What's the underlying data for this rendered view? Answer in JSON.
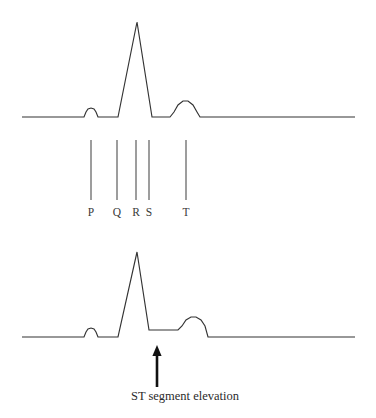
{
  "figure": {
    "title": "ECG waveform comparison: normal rhythm and ST segment elevation",
    "background_color": "#ffffff",
    "trace_color": "#333333",
    "tick_color": "#555555",
    "arrow_color": "#111111",
    "label_color": "#3a3a3a",
    "caption_color": "#2b2b2b"
  },
  "chart_data": {
    "type": "line",
    "title": "ECG waveform comparison: normal rhythm and ST segment elevation",
    "xlabel": "",
    "ylabel": "",
    "grid": false,
    "legend": "none",
    "xlim": [
      0,
      376
    ],
    "ylim": [
      418,
      0
    ],
    "note": "Coordinates are in screenshot pixel space; y increases downward. Amplitude is inverted relative to voltage (smaller y = taller deflection).",
    "series": [
      {
        "name": "normal-ecg-trace",
        "baseline_y": 117,
        "x_start": 22,
        "x_end": 355,
        "points": [
          [
            22,
            117
          ],
          [
            84,
            117
          ],
          [
            86,
            112
          ],
          [
            88,
            109
          ],
          [
            91,
            108
          ],
          [
            94,
            109
          ],
          [
            96,
            112
          ],
          [
            98,
            117
          ],
          [
            117,
            117
          ],
          [
            118,
            117
          ],
          [
            137,
            22
          ],
          [
            152,
            117
          ],
          [
            170,
            117
          ],
          [
            174,
            112
          ],
          [
            178,
            105
          ],
          [
            183,
            101
          ],
          [
            188,
            101
          ],
          [
            193,
            105
          ],
          [
            197,
            112
          ],
          [
            200,
            117
          ],
          [
            355,
            117
          ]
        ],
        "features": [
          {
            "label": "P",
            "x": 91,
            "peak_y": 108,
            "kind": "rounded-bump"
          },
          {
            "label": "Q",
            "x": 117,
            "peak_y": 117,
            "kind": "baseline-junction"
          },
          {
            "label": "R",
            "x": 137,
            "peak_y": 22,
            "kind": "sharp-spike"
          },
          {
            "label": "S",
            "x": 152,
            "peak_y": 117,
            "kind": "baseline-junction"
          },
          {
            "label": "T",
            "x": 186,
            "peak_y": 101,
            "kind": "rounded-dome"
          }
        ]
      },
      {
        "name": "st-elevation-ecg-trace",
        "baseline_y": 337,
        "st_segment_y": 330,
        "x_start": 22,
        "x_end": 355,
        "points": [
          [
            22,
            337
          ],
          [
            84,
            337
          ],
          [
            86,
            332
          ],
          [
            88,
            329
          ],
          [
            91,
            328
          ],
          [
            94,
            329
          ],
          [
            96,
            332
          ],
          [
            98,
            337
          ],
          [
            117,
            337
          ],
          [
            118,
            337
          ],
          [
            137,
            252
          ],
          [
            149,
            330
          ],
          [
            178,
            330
          ],
          [
            182,
            326
          ],
          [
            186,
            320
          ],
          [
            191,
            317
          ],
          [
            196,
            317
          ],
          [
            201,
            320
          ],
          [
            205,
            326
          ],
          [
            208,
            337
          ],
          [
            355,
            337
          ]
        ],
        "features": [
          {
            "label": "P",
            "x": 91,
            "peak_y": 328,
            "kind": "rounded-bump"
          },
          {
            "label": "R",
            "x": 137,
            "peak_y": 252,
            "kind": "sharp-spike"
          },
          {
            "label": "ST",
            "x": 163,
            "peak_y": 330,
            "kind": "elevated-plateau"
          },
          {
            "label": "T",
            "x": 193,
            "peak_y": 317,
            "kind": "rounded-dome"
          }
        ]
      }
    ],
    "annotations": [
      {
        "name": "st-elevation-arrow",
        "kind": "arrow",
        "direction": "up",
        "x": 157,
        "tip_y": 345,
        "tail_y": 387,
        "points_at": "st_segment_y"
      },
      {
        "name": "st-elevation-caption",
        "kind": "text",
        "text": "ST segment elevation",
        "x": 185,
        "y": 400
      }
    ]
  },
  "legend_scale": {
    "name": "pqrst-wave-legend",
    "tick_top_y": 140,
    "tick_bottom_y": 200,
    "label_y": 216,
    "ticks": [
      {
        "label": "P",
        "x": 91
      },
      {
        "label": "Q",
        "x": 117
      },
      {
        "label": "R",
        "x": 136
      },
      {
        "label": "S",
        "x": 149
      },
      {
        "label": "T",
        "x": 186
      }
    ]
  },
  "caption": {
    "st_elevation": "ST segment elevation"
  }
}
